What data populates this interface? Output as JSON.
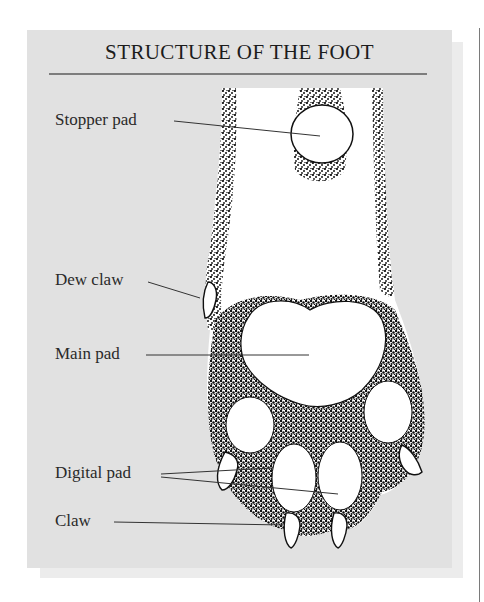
{
  "figure": {
    "title": "STRUCTURE OF THE FOOT",
    "panel_color": "#e1e1e1",
    "rule_color": "#7d7d7d",
    "labels": [
      {
        "id": "stopper-pad",
        "text": "Stopper pad"
      },
      {
        "id": "dew-claw",
        "text": "Dew claw"
      },
      {
        "id": "main-pad",
        "text": "Main pad"
      },
      {
        "id": "digital-pad",
        "text": "Digital pad"
      },
      {
        "id": "claw",
        "text": "Claw"
      }
    ]
  }
}
